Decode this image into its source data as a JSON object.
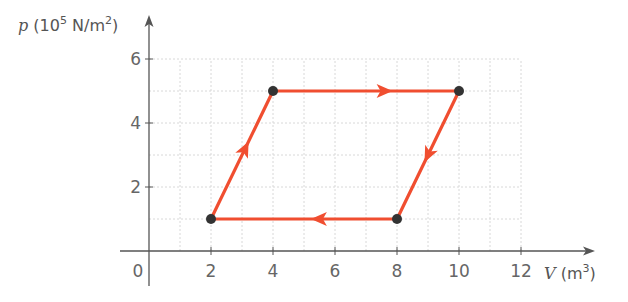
{
  "chart_data": {
    "type": "line",
    "title": "",
    "xlabel": "V (m³)",
    "ylabel": "p (10⁵ N/m²)",
    "xlabel_parts": {
      "symbol": "V",
      "unit_open": " (m",
      "unit_exp": "3",
      "unit_close": ")"
    },
    "ylabel_parts": {
      "symbol": "p",
      "unit_open": " (10",
      "unit_exp1": "5",
      "unit_mid": " N/m",
      "unit_exp2": "2",
      "unit_close": ")"
    },
    "xlim": [
      0,
      12
    ],
    "ylim": [
      0,
      6
    ],
    "x_ticks": [
      0,
      2,
      4,
      6,
      8,
      10,
      12
    ],
    "y_ticks": [
      2,
      4,
      6
    ],
    "x_tick_labels": [
      "0",
      "2",
      "4",
      "6",
      "8",
      "10",
      "12"
    ],
    "y_tick_labels": [
      "2",
      "4",
      "6"
    ],
    "grid": true,
    "grid_step": 1,
    "grid_style": "dashed",
    "legend": null,
    "series": [
      {
        "name": "thermodynamic cycle",
        "closed": true,
        "points": [
          {
            "V": 2,
            "p": 1
          },
          {
            "V": 4,
            "p": 5
          },
          {
            "V": 10,
            "p": 5
          },
          {
            "V": 8,
            "p": 1
          }
        ],
        "direction": "clockwise",
        "arrows": [
          {
            "from": [
              2,
              1
            ],
            "to": [
              4,
              5
            ],
            "direction": "up-right"
          },
          {
            "from": [
              4,
              5
            ],
            "to": [
              10,
              5
            ],
            "direction": "right"
          },
          {
            "from": [
              10,
              5
            ],
            "to": [
              8,
              1
            ],
            "direction": "down-left"
          },
          {
            "from": [
              8,
              1
            ],
            "to": [
              2,
              1
            ],
            "direction": "left"
          }
        ]
      }
    ]
  },
  "colors": {
    "cycle_line": "#f04e30",
    "vertex_dot": "#333333",
    "axis": "#555555",
    "grid": "#d8d8d8",
    "tick_text": "#666666"
  }
}
